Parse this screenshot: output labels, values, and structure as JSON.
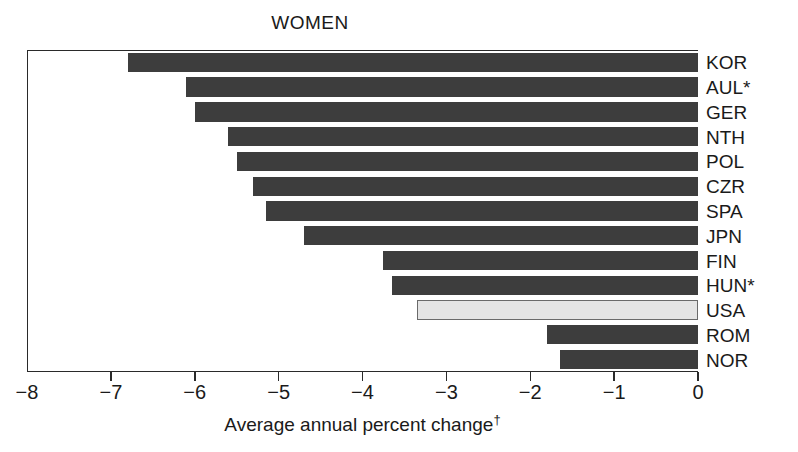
{
  "chart_data": {
    "type": "bar",
    "orientation": "horizontal",
    "title": "WOMEN",
    "xlabel": "Average annual percent change",
    "xlabel_footnote_marker": "†",
    "ylabel": "",
    "xlim": [
      -8,
      0
    ],
    "xticks": [
      -8,
      -7,
      -6,
      -5,
      -4,
      -3,
      -2,
      -1,
      0
    ],
    "xticklabels": [
      "−8",
      "−7",
      "−6",
      "−5",
      "−4",
      "−3",
      "−2",
      "−1",
      "0"
    ],
    "grid": false,
    "legend": false,
    "categories": [
      "KOR",
      "AUL*",
      "GER",
      "NTH",
      "POL",
      "CZR",
      "SPA",
      "JPN",
      "FIN",
      "HUN*",
      "USA",
      "ROM",
      "NOR"
    ],
    "values": [
      -6.8,
      -6.1,
      -6.0,
      -5.6,
      -5.5,
      -5.3,
      -5.15,
      -4.7,
      -3.75,
      -3.65,
      -3.35,
      -1.8,
      -1.65
    ],
    "highlight_category": "USA",
    "colors": {
      "bar": "#3d3d3d",
      "bar_highlight_fill": "#e4e4e4",
      "bar_highlight_edge": "#6a6a6a",
      "axis": "#2a2a2a",
      "text": "#1a1a1a",
      "background": "#ffffff"
    }
  },
  "bars": [
    {
      "label": "KOR",
      "value": -6.8,
      "highlight": false
    },
    {
      "label": "AUL*",
      "value": -6.1,
      "highlight": false
    },
    {
      "label": "GER",
      "value": -6.0,
      "highlight": false
    },
    {
      "label": "NTH",
      "value": -5.6,
      "highlight": false
    },
    {
      "label": "POL",
      "value": -5.5,
      "highlight": false
    },
    {
      "label": "CZR",
      "value": -5.3,
      "highlight": false
    },
    {
      "label": "SPA",
      "value": -5.15,
      "highlight": false
    },
    {
      "label": "JPN",
      "value": -4.7,
      "highlight": false
    },
    {
      "label": "FIN",
      "value": -3.75,
      "highlight": false
    },
    {
      "label": "HUN*",
      "value": -3.65,
      "highlight": false
    },
    {
      "label": "USA",
      "value": -3.35,
      "highlight": true
    },
    {
      "label": "ROM",
      "value": -1.8,
      "highlight": false
    },
    {
      "label": "NOR",
      "value": -1.65,
      "highlight": false
    }
  ]
}
